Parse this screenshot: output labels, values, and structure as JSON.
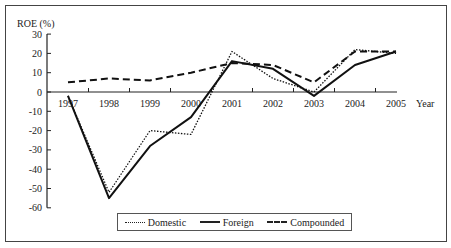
{
  "chart_data": {
    "type": "line",
    "title": "",
    "xlabel": "Year",
    "ylabel": "ROE (%)",
    "categories": [
      "1997",
      "1998",
      "1999",
      "2000",
      "2001",
      "2002",
      "2003",
      "2004",
      "2005"
    ],
    "yticks": [
      30,
      20,
      10,
      0,
      -10,
      -20,
      -30,
      -40,
      -50,
      -60
    ],
    "ylim": [
      -60,
      30
    ],
    "grid": false,
    "legend_position": "bottom",
    "series": [
      {
        "name": "Domestic",
        "style": "dotted",
        "values": [
          -2,
          -52,
          -20,
          -22,
          21,
          7,
          0,
          22,
          20
        ]
      },
      {
        "name": "Foreign",
        "style": "solid",
        "values": [
          -2,
          -55,
          -28,
          -13,
          16,
          12,
          -2,
          14,
          21
        ]
      },
      {
        "name": "Compounded",
        "style": "dashed",
        "values": [
          5,
          7,
          6,
          10,
          15,
          14,
          5,
          21,
          21
        ]
      }
    ]
  },
  "legend": {
    "items": [
      {
        "label": "Domestic"
      },
      {
        "label": "Foreign"
      },
      {
        "label": "Compounded"
      }
    ]
  },
  "axis": {
    "y_title": "ROE (%)",
    "x_title": "Year"
  }
}
